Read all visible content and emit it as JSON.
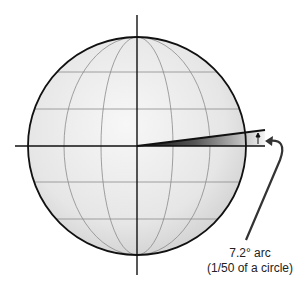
{
  "diagram": {
    "type": "globe-arc-illustration",
    "annotation": {
      "line1": "7.2° arc",
      "line2": "(1/50 of a circle)"
    },
    "colors": {
      "outline": "#111111",
      "grid": "#8a8a8a",
      "globe_fill_light": "#f4f4f4",
      "globe_fill_dark": "#d4d4d4",
      "wedge_dark": "#1a1a1a",
      "wedge_light": "#f2f2f2"
    }
  }
}
